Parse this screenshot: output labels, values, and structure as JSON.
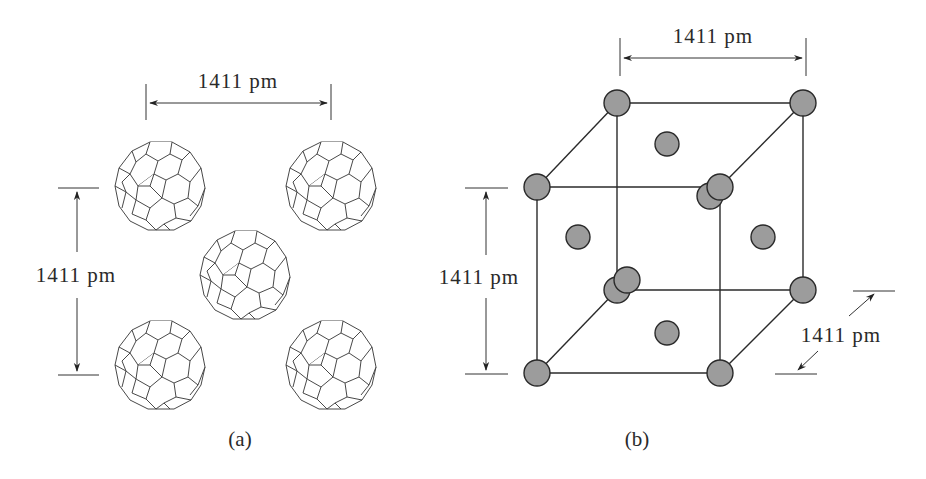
{
  "figure": {
    "panel_a": {
      "caption": "(a)",
      "description": "C60 buckyball arrangement (face view)",
      "horizontal_dimension": "1411 pm",
      "vertical_dimension": "1411 pm",
      "molecules": [
        {
          "id": "top-left",
          "cx": 155,
          "cy": 185
        },
        {
          "id": "top-right",
          "cx": 327,
          "cy": 185
        },
        {
          "id": "center",
          "cx": 241,
          "cy": 268
        },
        {
          "id": "bottom-left",
          "cx": 155,
          "cy": 365
        },
        {
          "id": "bottom-right",
          "cx": 327,
          "cy": 365
        }
      ]
    },
    "panel_b": {
      "caption": "(b)",
      "description": "Face-centered cubic unit cell",
      "top_dimension": "1411 pm",
      "left_dimension": "1411 pm",
      "depth_dimension": "1411 pm"
    }
  },
  "colors": {
    "atom_fill": "#9c9c9c",
    "line": "#2a2a2a",
    "background": "#ffffff"
  }
}
